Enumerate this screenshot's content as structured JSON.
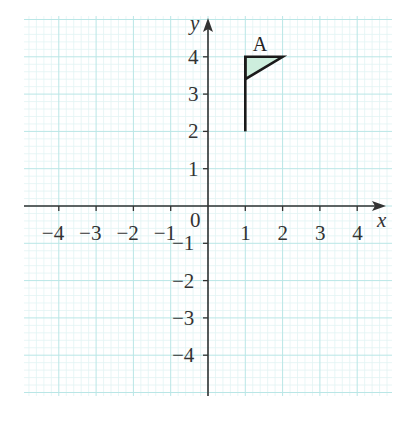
{
  "figure": {
    "x_axis_label": "x",
    "y_axis_label": "y",
    "origin_label": "0",
    "x_tick_labels": [
      "−4",
      "−3",
      "−2",
      "−1",
      "1",
      "2",
      "3",
      "4"
    ],
    "x_tick_values": [
      -4,
      -3,
      -2,
      -1,
      1,
      2,
      3,
      4
    ],
    "y_tick_labels": [
      "4",
      "3",
      "2",
      "1",
      "−1",
      "−2",
      "−3",
      "−4"
    ],
    "y_tick_values": [
      4,
      3,
      2,
      1,
      -1,
      -2,
      -3,
      -4
    ],
    "shape": {
      "label": "A",
      "pole": [
        [
          1,
          2
        ],
        [
          1,
          4
        ]
      ],
      "triangle": [
        [
          1,
          4
        ],
        [
          2,
          4
        ],
        [
          1,
          3.4
        ]
      ],
      "fill_color": "#cdeedd",
      "stroke_color": "#1a1a1a"
    },
    "colors": {
      "background": "#ffffff",
      "grid_major": "#b9e6e6",
      "grid_minor": "#e2f4f4",
      "axis": "#333333"
    },
    "range": {
      "x": [
        -5,
        5
      ],
      "y": [
        -5,
        5
      ]
    }
  }
}
